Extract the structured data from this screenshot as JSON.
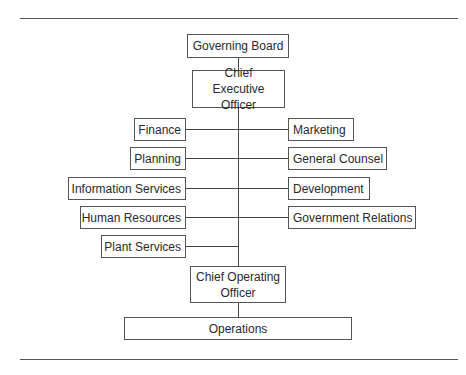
{
  "chart": {
    "top": [
      {
        "id": "governing-board",
        "label": "Governing Board"
      },
      {
        "id": "ceo",
        "label": "Chief Executive Officer"
      }
    ],
    "left_departments": [
      {
        "label": "Finance"
      },
      {
        "label": "Planning"
      },
      {
        "label": "Information Services"
      },
      {
        "label": "Human Resources"
      },
      {
        "label": "Plant Services"
      }
    ],
    "right_departments": [
      {
        "label": "Marketing"
      },
      {
        "label": "General Counsel"
      },
      {
        "label": "Development"
      },
      {
        "label": "Government Relations"
      }
    ],
    "bottom": [
      {
        "id": "coo",
        "label": "Chief Operating Officer"
      },
      {
        "id": "operations",
        "label": "Operations"
      }
    ]
  },
  "colors": {
    "line": "#444444",
    "border": "#555555",
    "text": "#2a2a2a",
    "background": "#ffffff"
  }
}
